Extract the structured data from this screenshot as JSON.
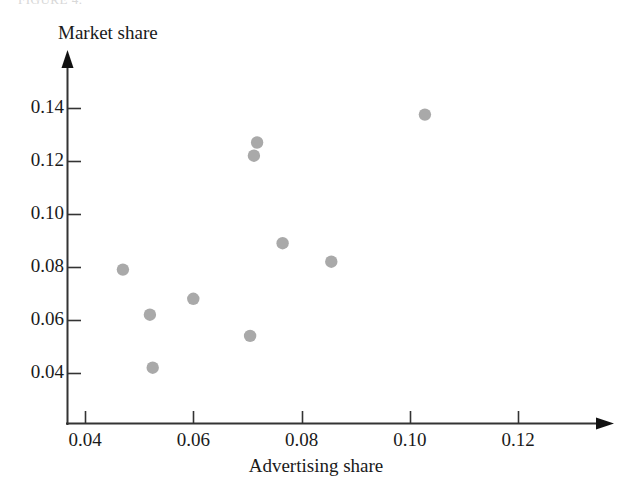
{
  "figure": {
    "top_fragment": "FIGURE 4.",
    "point_color": "#a9a9a9",
    "axis_color": "#333333"
  },
  "chart_data": {
    "type": "scatter",
    "title": "",
    "xlabel": "Advertising share",
    "ylabel": "Market share",
    "xlim": [
      0.034,
      0.128
    ],
    "ylim": [
      0.031,
      0.147
    ],
    "grid": false,
    "legend": null,
    "xticks": [
      0.04,
      0.06,
      0.08,
      0.1,
      0.12
    ],
    "xtick_labels": [
      "0.04",
      "0.06",
      "0.08",
      "0.10",
      "0.12"
    ],
    "yticks": [
      0.04,
      0.06,
      0.08,
      0.1,
      0.12,
      0.14
    ],
    "ytick_labels": [
      "0.04",
      "0.06",
      "0.08",
      "0.10",
      "0.12",
      "0.14"
    ],
    "series": [
      {
        "name": "firms",
        "x": [
          0.047,
          0.052,
          0.0525,
          0.06,
          0.0705,
          0.0712,
          0.0718,
          0.0765,
          0.0855,
          0.1028
        ],
        "y": [
          0.079,
          0.062,
          0.042,
          0.068,
          0.054,
          0.122,
          0.127,
          0.089,
          0.082,
          0.1375
        ]
      }
    ],
    "points": [
      {
        "x": 0.047,
        "y": 0.079
      },
      {
        "x": 0.052,
        "y": 0.062
      },
      {
        "x": 0.0525,
        "y": 0.042
      },
      {
        "x": 0.06,
        "y": 0.068
      },
      {
        "x": 0.0705,
        "y": 0.054
      },
      {
        "x": 0.0712,
        "y": 0.122
      },
      {
        "x": 0.0718,
        "y": 0.127
      },
      {
        "x": 0.0765,
        "y": 0.089
      },
      {
        "x": 0.0855,
        "y": 0.082
      },
      {
        "x": 0.1028,
        "y": 0.1375
      }
    ]
  }
}
